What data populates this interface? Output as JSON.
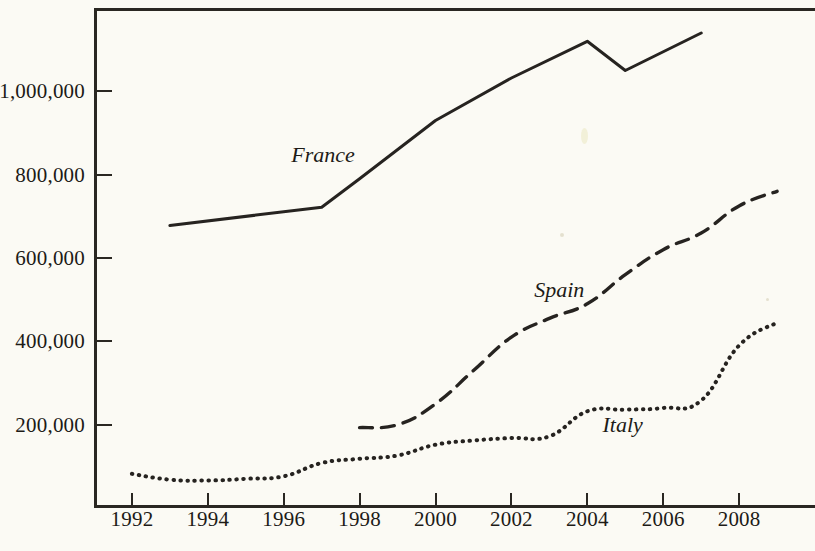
{
  "figure": {
    "background_color": "#fbfaf4",
    "ink_color": "#262320"
  },
  "chart_data": {
    "type": "line",
    "title": "",
    "subtitle": "",
    "xlabel": "",
    "ylabel": "",
    "xlim": [
      1991,
      2010
    ],
    "ylim": [
      0,
      1200000
    ],
    "grid": false,
    "legend_position": "inline-labels",
    "x_tick_labels": [
      "1992",
      "1994",
      "1996",
      "1998",
      "2000",
      "2002",
      "2004",
      "2006",
      "2008"
    ],
    "x_ticks": [
      1992,
      1994,
      1996,
      1998,
      2000,
      2002,
      2004,
      2006,
      2008
    ],
    "y_tick_labels": [
      "200,000",
      "400,000",
      "600,000",
      "800,000",
      "1,000,000"
    ],
    "y_ticks": [
      200000,
      400000,
      600000,
      800000,
      1000000
    ],
    "series": [
      {
        "name": "France",
        "style": "solid",
        "label_x": 1996.2,
        "label_y": 845000,
        "x": [
          1993,
          1997,
          1998,
          2000,
          2002,
          2004,
          2005,
          2007
        ],
        "values": [
          678000,
          722000,
          790000,
          930000,
          1032000,
          1120000,
          1050000,
          1140000
        ]
      },
      {
        "name": "Spain",
        "style": "dashed",
        "label_x": 2002.6,
        "label_y": 520000,
        "x": [
          1998,
          1999,
          2000,
          2001,
          2002,
          2003,
          2004,
          2005,
          2006,
          2007,
          2008,
          2009
        ],
        "values": [
          193000,
          200000,
          250000,
          330000,
          410000,
          455000,
          490000,
          560000,
          620000,
          660000,
          725000,
          760000
        ]
      },
      {
        "name": "Italy",
        "style": "dotted",
        "label_x": 2004.4,
        "label_y": 196000,
        "x": [
          1992,
          1993,
          1994,
          1995,
          1996,
          1997,
          1998,
          1999,
          2000,
          2001,
          2002,
          2003,
          2004,
          2005,
          2006,
          2007,
          2008,
          2009
        ],
        "values": [
          82000,
          68000,
          66000,
          70000,
          76000,
          108000,
          118000,
          126000,
          152000,
          162000,
          168000,
          172000,
          232000,
          236000,
          240000,
          258000,
          390000,
          445000
        ]
      }
    ]
  }
}
